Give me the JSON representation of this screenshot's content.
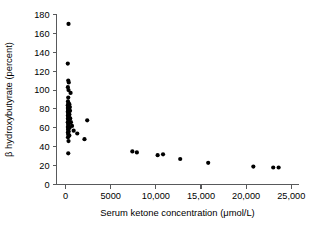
{
  "chart_data": {
    "type": "scatter",
    "title": "",
    "xlabel": "Serum ketone concentration (μmol/L)",
    "ylabel": "β hydroxybutyrate (percent)",
    "xlim": [
      -1000,
      25800
    ],
    "ylim": [
      0,
      180
    ],
    "grid": false,
    "legend": null,
    "marker": {
      "shape": "circle",
      "color": "#000000",
      "size_px": 3.2
    },
    "xticks": [
      0,
      5000,
      10000,
      15000,
      20000,
      25000
    ],
    "xticklabels": [
      "0",
      "5000",
      "10,000",
      "15,000",
      "20,000",
      "25,000"
    ],
    "yticks": [
      0,
      20,
      40,
      60,
      80,
      100,
      120,
      140,
      160,
      180
    ],
    "yticklabels": [
      "0",
      "20",
      "40",
      "60",
      "80",
      "100",
      "120",
      "140",
      "160",
      "180"
    ],
    "axis_color": "#58595b",
    "points": [
      {
        "x": 330,
        "y": 170
      },
      {
        "x": 250,
        "y": 128
      },
      {
        "x": 300,
        "y": 110
      },
      {
        "x": 360,
        "y": 108
      },
      {
        "x": 260,
        "y": 103
      },
      {
        "x": 330,
        "y": 100
      },
      {
        "x": 560,
        "y": 97
      },
      {
        "x": 300,
        "y": 92
      },
      {
        "x": 270,
        "y": 88
      },
      {
        "x": 330,
        "y": 86
      },
      {
        "x": 420,
        "y": 85
      },
      {
        "x": 250,
        "y": 84
      },
      {
        "x": 360,
        "y": 83
      },
      {
        "x": 300,
        "y": 82
      },
      {
        "x": 480,
        "y": 82
      },
      {
        "x": 260,
        "y": 81
      },
      {
        "x": 340,
        "y": 80
      },
      {
        "x": 400,
        "y": 80
      },
      {
        "x": 280,
        "y": 79
      },
      {
        "x": 310,
        "y": 78
      },
      {
        "x": 500,
        "y": 78
      },
      {
        "x": 250,
        "y": 77
      },
      {
        "x": 350,
        "y": 76
      },
      {
        "x": 290,
        "y": 75
      },
      {
        "x": 430,
        "y": 74
      },
      {
        "x": 260,
        "y": 73
      },
      {
        "x": 320,
        "y": 72
      },
      {
        "x": 380,
        "y": 71
      },
      {
        "x": 270,
        "y": 70
      },
      {
        "x": 520,
        "y": 70
      },
      {
        "x": 300,
        "y": 69
      },
      {
        "x": 2400,
        "y": 68
      },
      {
        "x": 340,
        "y": 67
      },
      {
        "x": 250,
        "y": 66
      },
      {
        "x": 600,
        "y": 66
      },
      {
        "x": 400,
        "y": 65
      },
      {
        "x": 290,
        "y": 64
      },
      {
        "x": 330,
        "y": 63
      },
      {
        "x": 720,
        "y": 62
      },
      {
        "x": 260,
        "y": 61
      },
      {
        "x": 450,
        "y": 60
      },
      {
        "x": 310,
        "y": 59
      },
      {
        "x": 280,
        "y": 58
      },
      {
        "x": 900,
        "y": 57
      },
      {
        "x": 350,
        "y": 56
      },
      {
        "x": 260,
        "y": 55
      },
      {
        "x": 1300,
        "y": 54
      },
      {
        "x": 300,
        "y": 53
      },
      {
        "x": 420,
        "y": 52
      },
      {
        "x": 270,
        "y": 50
      },
      {
        "x": 2100,
        "y": 48
      },
      {
        "x": 330,
        "y": 46
      },
      {
        "x": 300,
        "y": 33
      },
      {
        "x": 7400,
        "y": 35
      },
      {
        "x": 7900,
        "y": 34
      },
      {
        "x": 10200,
        "y": 31
      },
      {
        "x": 10800,
        "y": 32
      },
      {
        "x": 12700,
        "y": 27
      },
      {
        "x": 15800,
        "y": 23
      },
      {
        "x": 20800,
        "y": 19
      },
      {
        "x": 23000,
        "y": 18
      },
      {
        "x": 23600,
        "y": 18
      }
    ]
  }
}
